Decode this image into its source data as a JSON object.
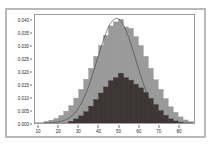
{
  "figure": {
    "background_color": "#ffffff",
    "frame_color": "#b9b9b9",
    "panel_border_color": "#9b9b9b"
  },
  "chart_data": {
    "type": "bar",
    "title": "",
    "subtitle": "",
    "xlabel": "",
    "ylabel": "",
    "xlim": [
      8,
      88
    ],
    "ylim": [
      0.0,
      0.0425
    ],
    "grid": false,
    "legend": null,
    "legend_position": "none",
    "annotations": [],
    "xticks": [
      10,
      20,
      30,
      40,
      50,
      60,
      70,
      80
    ],
    "xtick_labels": [
      "10",
      "20",
      "30",
      "40",
      "50",
      "60",
      "70",
      "80"
    ],
    "yticks": [
      0.0,
      0.005,
      0.01,
      0.015,
      0.02,
      0.025,
      0.03,
      0.035,
      0.04
    ],
    "ytick_labels": [
      "0.000",
      "0.005",
      "0.010",
      "0.015",
      "0.020",
      "0.025",
      "0.030",
      "0.035",
      "0.040"
    ],
    "bin_width": 2.5,
    "series": [
      {
        "name": "light-histogram",
        "type": "histogram",
        "color": "#9a9a9a",
        "edge_color": "#8a8a8a",
        "bin_starts": [
          12.5,
          15.0,
          17.5,
          20.0,
          22.5,
          25.0,
          27.5,
          30.0,
          32.5,
          35.0,
          37.5,
          40.0,
          42.5,
          45.0,
          47.5,
          50.0,
          52.5,
          55.0,
          57.5,
          60.0,
          62.5,
          65.0,
          67.5,
          70.0,
          72.5,
          75.0,
          77.5,
          80.0,
          82.5,
          85.0
        ],
        "values": [
          0.0006,
          0.0011,
          0.0018,
          0.003,
          0.0046,
          0.0068,
          0.0098,
          0.0132,
          0.0172,
          0.0215,
          0.0262,
          0.0305,
          0.0345,
          0.0382,
          0.0398,
          0.0408,
          0.0378,
          0.0372,
          0.034,
          0.0305,
          0.0262,
          0.0215,
          0.017,
          0.0132,
          0.0096,
          0.0064,
          0.0042,
          0.0024,
          0.0012,
          0.0005
        ]
      },
      {
        "name": "dark-histogram",
        "type": "histogram",
        "color": "#3e3535",
        "edge_color": "#332b2b",
        "bin_starts": [
          25.0,
          27.5,
          30.0,
          32.5,
          35.0,
          37.5,
          40.0,
          42.5,
          45.0,
          47.5,
          50.0,
          52.5,
          55.0,
          57.5,
          60.0,
          62.5,
          65.0,
          67.5,
          70.0,
          72.5,
          75.0,
          77.5,
          80.0
        ],
        "values": [
          0.0006,
          0.0016,
          0.0028,
          0.0044,
          0.0066,
          0.0092,
          0.0118,
          0.0142,
          0.0166,
          0.0178,
          0.0196,
          0.0178,
          0.0168,
          0.0152,
          0.0138,
          0.012,
          0.0096,
          0.0072,
          0.0048,
          0.003,
          0.0016,
          0.0008,
          0.0003
        ]
      },
      {
        "name": "normal-curve",
        "type": "line",
        "color": "#4a4a4a",
        "line_width": 0.7,
        "mean": 49.0,
        "std_dev": 9.7,
        "peak_value": 0.0411,
        "x": [
          12,
          16,
          20,
          24,
          28,
          32,
          36,
          40,
          44,
          48,
          52,
          56,
          60,
          64,
          68,
          72,
          76,
          80,
          84,
          88
        ],
        "y": [
          0.0002,
          0.0008,
          0.0023,
          0.0057,
          0.0118,
          0.0205,
          0.0302,
          0.0376,
          0.0409,
          0.0411,
          0.0383,
          0.032,
          0.0238,
          0.0154,
          0.0086,
          0.0041,
          0.0016,
          0.0005,
          0.0001,
          0.0
        ]
      }
    ]
  }
}
